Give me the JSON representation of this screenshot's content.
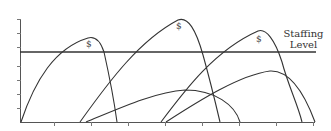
{
  "diagram": {
    "type": "staffing-curves",
    "staffing_label_line1": "Staffing",
    "staffing_label_line2": "Level",
    "dollar_marks": [
      "$",
      "$",
      "$"
    ],
    "colors": {
      "line": "#333333",
      "axis": "#555555",
      "background": "#ffffff"
    },
    "axes": {
      "x_ticks": 8,
      "y_ticks": 8
    },
    "curves": [
      {
        "name": "project-1",
        "has_dollar": true
      },
      {
        "name": "project-2",
        "has_dollar": true
      },
      {
        "name": "project-3",
        "has_dollar": true
      },
      {
        "name": "project-4",
        "has_dollar": false
      },
      {
        "name": "project-5",
        "has_dollar": false
      }
    ]
  }
}
